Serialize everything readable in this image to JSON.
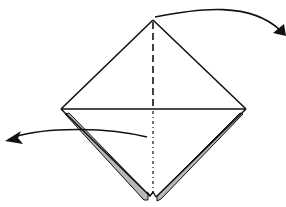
{
  "diagram": {
    "type": "origami-fold-step",
    "background": "#ffffff",
    "stroke_color": "#111111",
    "flap_fill": "#b8b8b8",
    "shape": "square-base-diamond",
    "vertices": {
      "top": [
        153,
        20
      ],
      "left": [
        61,
        109
      ],
      "right": [
        246,
        109
      ],
      "bottom": [
        153,
        197
      ]
    },
    "lines": [
      {
        "name": "horizontal-center-crease",
        "style": "solid"
      },
      {
        "name": "upper-vertical-valley-fold",
        "style": "dashed"
      },
      {
        "name": "lower-vertical-mountain-fold",
        "style": "dash-dot"
      }
    ],
    "arrows": [
      {
        "name": "fold-back-right-arrow",
        "direction": "right-down",
        "meaning": "fold top half behind"
      },
      {
        "name": "fold-left-arrow",
        "direction": "left",
        "meaning": "fold bottom flap to the left"
      }
    ]
  }
}
